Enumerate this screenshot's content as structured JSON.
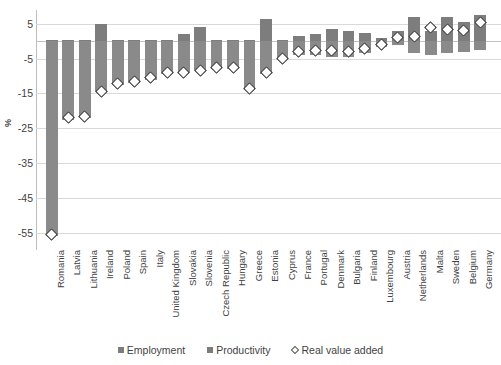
{
  "chart_data": {
    "type": "bar",
    "title": "",
    "subtitle": "",
    "xlabel": "",
    "ylabel": "%",
    "ylim": [
      -60,
      9
    ],
    "yticks": [
      5,
      -5,
      -15,
      -25,
      -35,
      -45,
      -55
    ],
    "ytick_labels": [
      "5",
      "-5",
      "-15",
      "-25",
      "-35",
      "-45",
      "-55"
    ],
    "grid": true,
    "stacked": true,
    "legend_position": "bottom",
    "legend": [
      "Employment",
      "Productivity",
      "Real value added"
    ],
    "categories": [
      "Romania",
      "Latvia",
      "Lithuania",
      "Ireland",
      "Poland",
      "Spain",
      "Italy",
      "United Kingdom",
      "Slovakia",
      "Slovenia",
      "Czech Republic",
      "Hungary",
      "Greece",
      "Estonia",
      "Cyprus",
      "France",
      "Portugal",
      "Denmark",
      "Bulgaria",
      "Finland",
      "Luxembourg",
      "Austria",
      "Netherlands",
      "Malta",
      "Sweden",
      "Belgium",
      "Germany"
    ],
    "series": [
      {
        "name": "Employment",
        "values": [
          -56.0,
          -22.5,
          -22.0,
          -14.5,
          -12.5,
          -12.0,
          -11.0,
          -9.5,
          -9.0,
          -8.5,
          -8.0,
          -8.0,
          -14.0,
          -9.5,
          -5.5,
          -4.0,
          -4.0,
          -4.5,
          -4.5,
          -3.5,
          -1.5,
          -1.0,
          -3.5,
          -4.0,
          -3.5,
          -3.0,
          -2.5
        ]
      },
      {
        "name": "Productivity",
        "values": [
          0.5,
          0.5,
          0.5,
          5.0,
          0.5,
          0.5,
          0.5,
          0.5,
          2.0,
          4.0,
          0.5,
          0.5,
          0.5,
          6.5,
          0.5,
          1.5,
          2.0,
          3.5,
          3.0,
          2.5,
          1.0,
          3.0,
          7.0,
          3.0,
          7.0,
          5.5,
          7.5
        ]
      },
      {
        "name": "Real value added",
        "type": "marker",
        "values": [
          -55.5,
          -22.0,
          -21.5,
          -14.5,
          -12.0,
          -11.5,
          -10.5,
          -9.0,
          -9.0,
          -8.5,
          -7.5,
          -7.5,
          -13.5,
          -9.0,
          -5.0,
          -3.0,
          -2.5,
          -2.5,
          -3.0,
          -2.0,
          -1.0,
          1.0,
          1.5,
          4.0,
          3.5,
          3.0,
          5.5
        ]
      }
    ]
  }
}
